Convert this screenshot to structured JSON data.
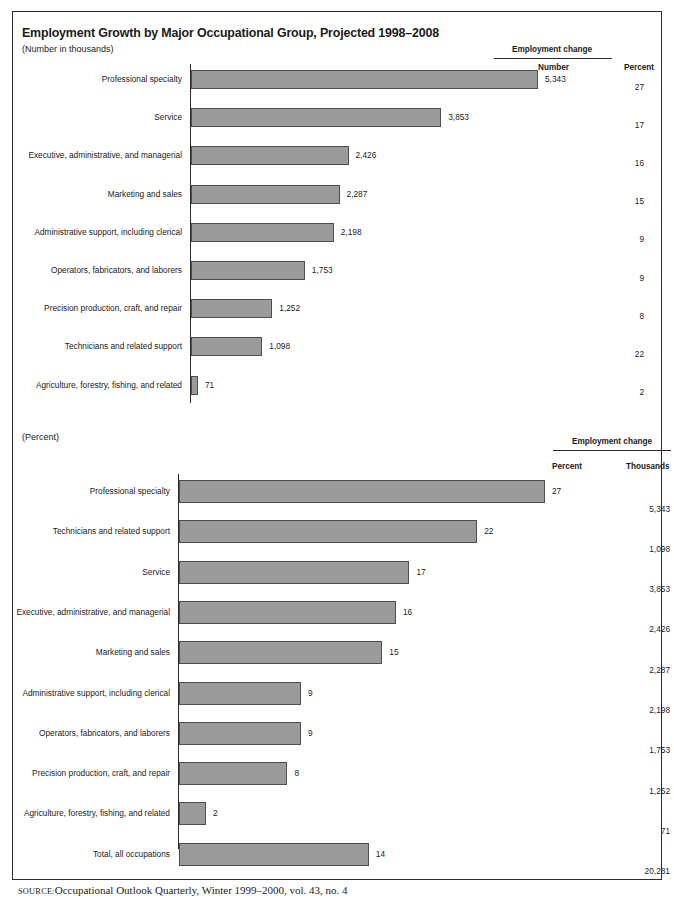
{
  "document": {
    "top_crumb": "",
    "source_key": "Source:",
    "source_text": "Occupational Outlook Quarterly, Winter 1999–2000, vol. 43, no. 4"
  },
  "colors": {
    "bar_fill": "#9b9b9b",
    "bar_stroke": "#4d4d4d",
    "rule": "#2b2b2b",
    "text": "#1a1a1a"
  },
  "chart1": {
    "title": "Employment Growth by Major Occupational Group, Projected 1998–2008",
    "subtitle": "(Number in thousands)",
    "group_header": "Employment change",
    "col_number": "Number",
    "col_percent": "Percent"
  },
  "chart2": {
    "subtitle": "(Percent)",
    "group_header": "Employment change",
    "col_percent": "Percent",
    "col_thousands": "Thousands"
  },
  "chart_data": [
    {
      "type": "bar",
      "orientation": "horizontal",
      "title": "Employment Growth by Major Occupational Group, Projected 1998–2008",
      "subtitle": "(Number in thousands)",
      "xlabel": "",
      "ylabel": "",
      "xlim": [
        0,
        5343
      ],
      "grid": false,
      "legend": "none",
      "value_unit": "thousands",
      "categories": [
        "Professional specialty",
        "Service",
        "Executive, administrative, and managerial",
        "Marketing and sales",
        "Administrative support, including clerical",
        "Operators, fabricators, and laborers",
        "Precision production, craft, and repair",
        "Technicians and related support",
        "Agriculture, forestry, fishing, and related"
      ],
      "values": [
        5343,
        3853,
        2426,
        2287,
        2198,
        1753,
        1252,
        1098,
        71
      ],
      "value_labels": [
        "5,343",
        "3,853",
        "2,426",
        "2,287",
        "2,198",
        "1,753",
        "1,252",
        "1,098",
        "71"
      ],
      "extra_column": {
        "header_group": "Employment change",
        "headers": [
          "Number",
          "Percent"
        ],
        "percent_values": [
          27,
          17,
          16,
          15,
          9,
          9,
          8,
          22,
          2
        ],
        "percent_labels": [
          "27",
          "17",
          "16",
          "15",
          "9",
          "9",
          "8",
          "22",
          "2"
        ]
      }
    },
    {
      "type": "bar",
      "orientation": "horizontal",
      "title": "",
      "subtitle": "(Percent)",
      "xlabel": "",
      "ylabel": "",
      "xlim": [
        0,
        27
      ],
      "grid": false,
      "legend": "none",
      "value_unit": "percent",
      "categories": [
        "Professional specialty",
        "Technicians and related support",
        "Service",
        "Executive, administrative, and managerial",
        "Marketing and sales",
        "Administrative support, including clerical",
        "Operators, fabricators, and laborers",
        "Precision production, craft, and repair",
        "Agriculture, forestry, fishing, and related",
        "Total, all occupations"
      ],
      "values": [
        27,
        22,
        17,
        16,
        15,
        9,
        9,
        8,
        2,
        14
      ],
      "value_labels": [
        "27",
        "22",
        "17",
        "16",
        "15",
        "9",
        "9",
        "8",
        "2",
        "14"
      ],
      "extra_column": {
        "header_group": "Employment change",
        "headers": [
          "Percent",
          "Thousands"
        ],
        "thousands_values": [
          5343,
          1098,
          3853,
          2426,
          2287,
          2198,
          1753,
          1252,
          71,
          20281
        ],
        "thousands_labels": [
          "5,343",
          "1,098",
          "3,853",
          "2,426",
          "2,287",
          "2,198",
          "1,753",
          "1,252",
          "71",
          "20,281"
        ]
      }
    }
  ]
}
